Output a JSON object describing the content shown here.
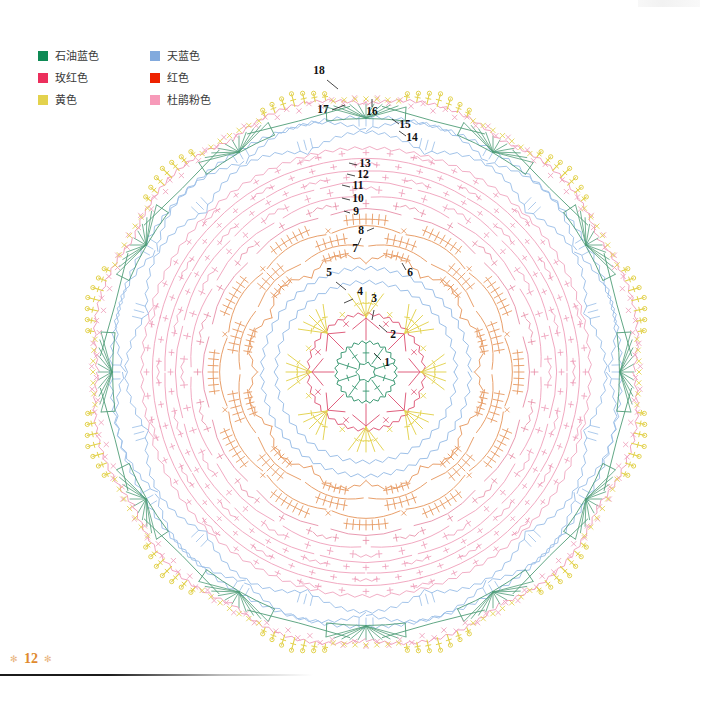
{
  "page": {
    "number": "12",
    "flourish_left": "✻",
    "flourish_right": "✻"
  },
  "legend": {
    "items": [
      {
        "label": "石油蓝色",
        "color": "#0e8a55",
        "name": "petroleum-blue"
      },
      {
        "label": "天蓝色",
        "color": "#82aadd",
        "name": "sky-blue"
      },
      {
        "label": "玫红色",
        "color": "#ec2f5c",
        "name": "rose-red"
      },
      {
        "label": "红色",
        "color": "#ee2200",
        "name": "red"
      },
      {
        "label": "黄色",
        "color": "#e3d24d",
        "name": "yellow"
      },
      {
        "label": "杜鹃粉色",
        "color": "#f79ab9",
        "name": "azalea-pink"
      }
    ]
  },
  "chart_data": {
    "type": "diagram",
    "title": "",
    "subtype": "crochet-round-doily-chart",
    "center": {
      "x": 366,
      "y": 372
    },
    "outer_radius": 292,
    "symmetry": 12,
    "round_labels": [
      "1",
      "2",
      "3",
      "4",
      "5",
      "6",
      "7",
      "8",
      "9",
      "10",
      "11",
      "12",
      "13",
      "14",
      "15",
      "16",
      "17",
      "18"
    ],
    "label_positions": [
      {
        "n": "1",
        "x": 387,
        "y": 366,
        "lx": 381,
        "ly": 360,
        "tx": 374,
        "ty": 353
      },
      {
        "n": "2",
        "x": 393,
        "y": 338,
        "lx": 387,
        "ly": 332,
        "tx": 379,
        "ty": 325
      },
      {
        "n": "3",
        "x": 374,
        "y": 302,
        "lx": 374,
        "ly": 310,
        "tx": 372,
        "ty": 320
      },
      {
        "n": "4",
        "x": 360,
        "y": 295,
        "lx": 353,
        "ly": 299,
        "tx": 344,
        "ty": 303
      },
      {
        "n": "5",
        "x": 329,
        "y": 276,
        "lx": 336,
        "ly": 282,
        "tx": 346,
        "ty": 290
      },
      {
        "n": "6",
        "x": 410,
        "y": 276,
        "lx": 406,
        "ly": 270,
        "tx": 402,
        "ty": 263
      },
      {
        "n": "7",
        "x": 355,
        "y": 252,
        "lx": 358,
        "ly": 245,
        "tx": 361,
        "ty": 238
      },
      {
        "n": "8",
        "x": 361,
        "y": 234,
        "lx": 367,
        "ly": 231,
        "tx": 374,
        "ty": 228
      },
      {
        "n": "9",
        "x": 356,
        "y": 215,
        "lx": 350,
        "ly": 213,
        "tx": 344,
        "ty": 211
      },
      {
        "n": "10",
        "x": 358,
        "y": 202,
        "lx": 350,
        "ly": 200,
        "tx": 342,
        "ty": 198
      },
      {
        "n": "11",
        "x": 358,
        "y": 189,
        "lx": 350,
        "ly": 187,
        "tx": 342,
        "ty": 185
      },
      {
        "n": "12",
        "x": 363,
        "y": 178,
        "lx": 355,
        "ly": 176,
        "tx": 347,
        "ty": 174
      },
      {
        "n": "13",
        "x": 365,
        "y": 167,
        "lx": 357,
        "ly": 165,
        "tx": 349,
        "ty": 163
      },
      {
        "n": "14",
        "x": 412,
        "y": 141,
        "lx": 406,
        "ly": 136,
        "tx": 399,
        "ty": 131
      },
      {
        "n": "15",
        "x": 405,
        "y": 128,
        "lx": 399,
        "ly": 124,
        "tx": 392,
        "ty": 119
      },
      {
        "n": "16",
        "x": 372,
        "y": 115,
        "lx": 372,
        "ly": 107,
        "tx": 372,
        "ty": 99
      },
      {
        "n": "17",
        "x": 323,
        "y": 113,
        "lx": 332,
        "ly": 110,
        "tx": 345,
        "ty": 105
      },
      {
        "n": "18",
        "x": 319,
        "y": 74,
        "lx": 327,
        "ly": 80,
        "tx": 338,
        "ty": 89
      }
    ],
    "rounds": [
      {
        "n": 1,
        "radius": 30,
        "color": "#3f9b76",
        "stitch": "ring-with-spokes"
      },
      {
        "n": 2,
        "radius": 58,
        "color": "#e0607e",
        "stitch": "star-arrow-petals"
      },
      {
        "n": 3,
        "radius": 76,
        "color": "#e3d24d",
        "stitch": "long-spike-fan"
      },
      {
        "n": 4,
        "radius": 90,
        "color": "#9dc0e8",
        "stitch": "chain-arc-ring"
      },
      {
        "n": 5,
        "radius": 104,
        "color": "#9dc0e8",
        "stitch": "chain-arc-ring"
      },
      {
        "n": 6,
        "radius": 122,
        "color": "#e79a62",
        "stitch": "shell-cluster"
      },
      {
        "n": 7,
        "radius": 140,
        "color": "#e79a62",
        "stitch": "shell-cluster"
      },
      {
        "n": 8,
        "radius": 158,
        "color": "#e79a62",
        "stitch": "shell-cluster"
      },
      {
        "n": 9,
        "radius": 172,
        "color": "#e78fa8",
        "stitch": "shell-cluster"
      },
      {
        "n": 10,
        "radius": 186,
        "color": "#ef9fba",
        "stitch": "shell-cluster"
      },
      {
        "n": 11,
        "radius": 198,
        "color": "#ef9fba",
        "stitch": "shell-cluster"
      },
      {
        "n": 12,
        "radius": 210,
        "color": "#ef9fba",
        "stitch": "shell-cluster"
      },
      {
        "n": 13,
        "radius": 222,
        "color": "#ef9fba",
        "stitch": "shell-cluster"
      },
      {
        "n": 14,
        "radius": 238,
        "color": "#9dc0e8",
        "stitch": "chain-mesh-arc"
      },
      {
        "n": 15,
        "radius": 252,
        "color": "#9dc0e8",
        "stitch": "chain-mesh-arc"
      },
      {
        "n": 16,
        "radius": 262,
        "color": "#4f9d77",
        "stitch": "green-fan"
      },
      {
        "n": 17,
        "radius": 272,
        "color": "#ef9fba",
        "stitch": "picot-zigzag"
      },
      {
        "n": 18,
        "radius": 288,
        "color": "#e3d24d",
        "stitch": "outer-picot-spike"
      }
    ]
  }
}
